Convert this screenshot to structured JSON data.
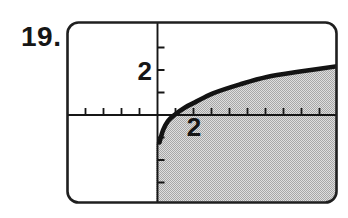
{
  "figure": {
    "problem_number": "19."
  },
  "chart_data": {
    "type": "area",
    "title": "",
    "x_axis": {
      "label": "",
      "tick_values": [
        -4,
        -3,
        -2,
        -1,
        1,
        2,
        3,
        4,
        5,
        6,
        7,
        8,
        9,
        10
      ],
      "labeled_tick": {
        "value": 2,
        "label": "2"
      },
      "range": [
        -5,
        10
      ],
      "unit_per_tick": 1
    },
    "y_axis": {
      "label": "",
      "tick_values": [
        -3,
        -2,
        -1,
        1,
        2,
        3
      ],
      "labeled_tick": {
        "value": 2,
        "label": "2"
      },
      "range": [
        -4,
        4
      ],
      "unit_per_tick": 1
    },
    "series": [
      {
        "name": "curve",
        "points": [
          [
            0.11,
            -1.22
          ],
          [
            0.31,
            -0.67
          ],
          [
            0.58,
            -0.27
          ],
          [
            0.94,
            0.0
          ],
          [
            1.53,
            0.33
          ],
          [
            2.08,
            0.56
          ],
          [
            3.08,
            0.96
          ],
          [
            4.58,
            1.36
          ],
          [
            6.08,
            1.69
          ],
          [
            7.92,
            1.93
          ],
          [
            10.1,
            2.18
          ]
        ]
      }
    ],
    "shaded_region": "below curve, x >= 0",
    "grid": false,
    "legend": false,
    "colors": {
      "ink": "#161616",
      "shade_base": "#dedede",
      "shade_dot": "#a7a7a7",
      "background": "#ffffff"
    }
  }
}
